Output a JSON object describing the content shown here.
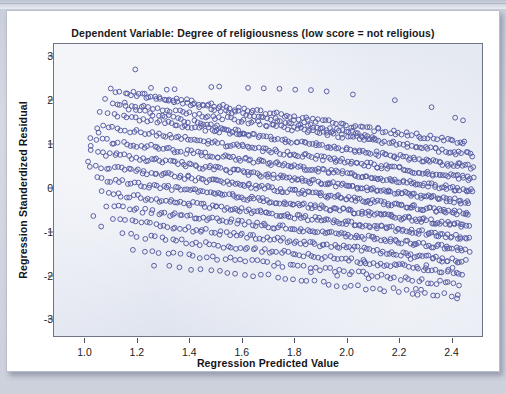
{
  "chart_data": {
    "type": "scatter",
    "title": "Dependent Variable: Degree of religiousness (low score = not religious)",
    "xlabel": "Regression Predicted Value",
    "ylabel": "Regression Standerdized Residual",
    "xlim": [
      0.88,
      2.52
    ],
    "ylim": [
      -3.4,
      3.3
    ],
    "xticks": [
      "1.0",
      "1.2",
      "1.4",
      "1.6",
      "1.8",
      "2.0",
      "2.2",
      "2.4"
    ],
    "xtick_values": [
      1.0,
      1.2,
      1.4,
      1.6,
      1.8,
      2.0,
      2.2,
      2.4
    ],
    "yticks": [
      "3",
      "2",
      "1",
      "0",
      "-1",
      "-2",
      "-3"
    ],
    "ytick_values": [
      3,
      2,
      1,
      0,
      -1,
      -2,
      -3
    ],
    "grid": false,
    "legend": null,
    "marker": {
      "shape": "open-circle",
      "radius": 2.4,
      "stroke": "#5b60a6",
      "fill": "none"
    },
    "plot_background": "#e5e9f2",
    "page_background": "#ffffff",
    "bands": [
      {
        "name": "band-1-highest",
        "intercept": 3.35,
        "slope": -1.3,
        "x_start": 1.12,
        "x_end": 1.62,
        "jitter": 0.1,
        "n": 34
      },
      {
        "name": "band-2",
        "intercept": 3.4,
        "slope": -1.05,
        "x_start": 1.12,
        "x_end": 2.1,
        "jitter": 0.1,
        "n": 70
      },
      {
        "name": "band-3",
        "intercept": 3.25,
        "slope": -0.9,
        "x_start": 1.1,
        "x_end": 2.45,
        "jitter": 0.1,
        "n": 95
      },
      {
        "name": "band-4",
        "intercept": 2.95,
        "slope": -0.88,
        "x_start": 1.08,
        "x_end": 2.48,
        "jitter": 0.1,
        "n": 110
      },
      {
        "name": "band-5",
        "intercept": 2.62,
        "slope": -0.86,
        "x_start": 1.06,
        "x_end": 2.48,
        "jitter": 0.1,
        "n": 125
      },
      {
        "name": "band-6",
        "intercept": 2.3,
        "slope": -0.84,
        "x_start": 1.04,
        "x_end": 2.48,
        "jitter": 0.1,
        "n": 135
      },
      {
        "name": "band-7",
        "intercept": 1.98,
        "slope": -0.82,
        "x_start": 1.02,
        "x_end": 2.48,
        "jitter": 0.1,
        "n": 145
      },
      {
        "name": "band-8",
        "intercept": 1.66,
        "slope": -0.8,
        "x_start": 1.02,
        "x_end": 2.46,
        "jitter": 0.1,
        "n": 150
      },
      {
        "name": "band-9",
        "intercept": 1.34,
        "slope": -0.78,
        "x_start": 1.02,
        "x_end": 2.46,
        "jitter": 0.1,
        "n": 150
      },
      {
        "name": "band-10",
        "intercept": 1.02,
        "slope": -0.76,
        "x_start": 1.04,
        "x_end": 2.46,
        "jitter": 0.1,
        "n": 145
      },
      {
        "name": "band-11",
        "intercept": 0.7,
        "slope": -0.74,
        "x_start": 1.06,
        "x_end": 2.46,
        "jitter": 0.1,
        "n": 135
      },
      {
        "name": "band-12",
        "intercept": 0.38,
        "slope": -0.72,
        "x_start": 1.08,
        "x_end": 2.46,
        "jitter": 0.1,
        "n": 120
      },
      {
        "name": "band-13",
        "intercept": 0.06,
        "slope": -0.7,
        "x_start": 1.1,
        "x_end": 2.45,
        "jitter": 0.1,
        "n": 105
      },
      {
        "name": "band-14",
        "intercept": -0.26,
        "slope": -0.68,
        "x_start": 1.14,
        "x_end": 2.44,
        "jitter": 0.1,
        "n": 85
      },
      {
        "name": "band-15",
        "intercept": -0.58,
        "slope": -0.66,
        "x_start": 1.18,
        "x_end": 2.42,
        "jitter": 0.11,
        "n": 62
      },
      {
        "name": "band-16-lowest",
        "intercept": -0.92,
        "slope": -0.64,
        "x_start": 1.26,
        "x_end": 2.42,
        "jitter": 0.12,
        "n": 40
      }
    ],
    "outliers": [
      {
        "x": 1.19,
        "y": 2.72
      },
      {
        "x": 1.25,
        "y": 2.3
      },
      {
        "x": 1.31,
        "y": 2.26
      },
      {
        "x": 1.34,
        "y": 2.27
      },
      {
        "x": 1.48,
        "y": 2.32
      },
      {
        "x": 1.51,
        "y": 2.33
      },
      {
        "x": 1.62,
        "y": 2.3
      },
      {
        "x": 1.68,
        "y": 2.29
      },
      {
        "x": 1.74,
        "y": 2.28
      },
      {
        "x": 1.8,
        "y": 2.26
      },
      {
        "x": 1.86,
        "y": 2.25
      },
      {
        "x": 1.92,
        "y": 2.22
      },
      {
        "x": 2.02,
        "y": 2.15
      },
      {
        "x": 2.18,
        "y": 2.02
      },
      {
        "x": 2.32,
        "y": 1.86
      },
      {
        "x": 2.41,
        "y": 1.62
      },
      {
        "x": 2.44,
        "y": 1.56
      },
      {
        "x": 1.05,
        "y": 1.28
      },
      {
        "x": 1.02,
        "y": 0.98
      },
      {
        "x": 1.01,
        "y": 0.62
      },
      {
        "x": 1.03,
        "y": -0.62
      },
      {
        "x": 1.06,
        "y": -0.86
      },
      {
        "x": 2.06,
        "y": -1.62
      },
      {
        "x": 2.18,
        "y": -1.72
      },
      {
        "x": 2.24,
        "y": -1.6
      },
      {
        "x": 2.3,
        "y": -1.74
      },
      {
        "x": 2.36,
        "y": -1.66
      },
      {
        "x": 2.4,
        "y": -1.8
      },
      {
        "x": 2.26,
        "y": -2.28
      },
      {
        "x": 2.28,
        "y": -2.3
      },
      {
        "x": 2.42,
        "y": -2.42
      },
      {
        "x": 1.96,
        "y": -1.98
      },
      {
        "x": 2.08,
        "y": -2.04
      },
      {
        "x": 1.86,
        "y": -1.9
      }
    ]
  }
}
